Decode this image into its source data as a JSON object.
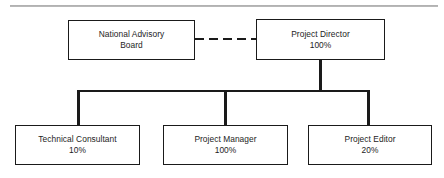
{
  "chart_data": {
    "type": "diagram",
    "diagram_type": "organizational-chart",
    "title": "",
    "nodes": [
      {
        "id": "advisory-board",
        "line1": "National Advisory",
        "line2": "Board",
        "allocation": "",
        "level": 1
      },
      {
        "id": "project-director",
        "line1": "Project Director",
        "line2": "100%",
        "allocation": "100%",
        "level": 1
      },
      {
        "id": "technical-consultant",
        "line1": "Technical Consultant",
        "line2": "10%",
        "allocation": "10%",
        "level": 2
      },
      {
        "id": "project-manager",
        "line1": "Project Manager",
        "line2": "100%",
        "allocation": "100%",
        "level": 2
      },
      {
        "id": "project-editor",
        "line1": "Project Editor",
        "line2": "20%",
        "allocation": "20%",
        "level": 2
      }
    ],
    "edges": [
      {
        "from": "advisory-board",
        "to": "project-director",
        "style": "dashed",
        "meaning": "advisory"
      },
      {
        "from": "project-director",
        "to": "technical-consultant",
        "style": "solid",
        "meaning": "reports-to"
      },
      {
        "from": "project-director",
        "to": "project-manager",
        "style": "solid",
        "meaning": "reports-to"
      },
      {
        "from": "project-director",
        "to": "project-editor",
        "style": "solid",
        "meaning": "reports-to"
      }
    ],
    "colors": {
      "line": "#1a1a1a",
      "box_fill": "#ffffff",
      "text": "#1d1d1d",
      "top_rule": "#9a9a9a"
    }
  },
  "nodes": {
    "advisory_board": {
      "line1": "National Advisory",
      "line2": "Board"
    },
    "project_director": {
      "line1": "Project Director",
      "line2": "100%"
    },
    "technical_consultant": {
      "line1": "Technical Consultant",
      "line2": "10%"
    },
    "project_manager": {
      "line1": "Project Manager",
      "line2": "100%"
    },
    "project_editor": {
      "line1": "Project Editor",
      "line2": "20%"
    }
  }
}
